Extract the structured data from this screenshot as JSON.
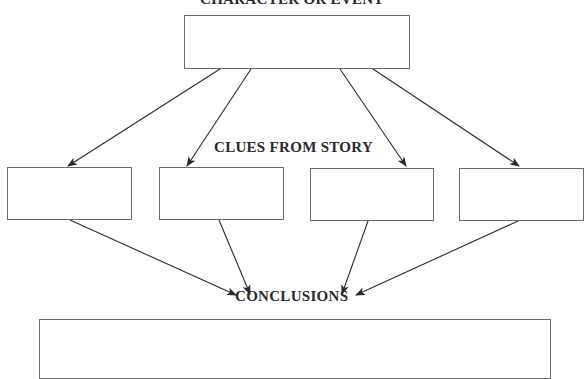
{
  "diagram": {
    "top_label": "CHARACTER OR EVENT",
    "clues_label": "CLUES FROM STORY",
    "conclusions_label": "CONCLUSIONS",
    "clue_boxes": [
      {
        "text": ""
      },
      {
        "text": ""
      },
      {
        "text": ""
      },
      {
        "text": ""
      }
    ],
    "top_box": {
      "text": ""
    },
    "conclusions_box": {
      "text": ""
    },
    "colors": {
      "line": "#2a2a2a",
      "box_border": "#6b6b6b",
      "background": "#ffffff"
    }
  }
}
